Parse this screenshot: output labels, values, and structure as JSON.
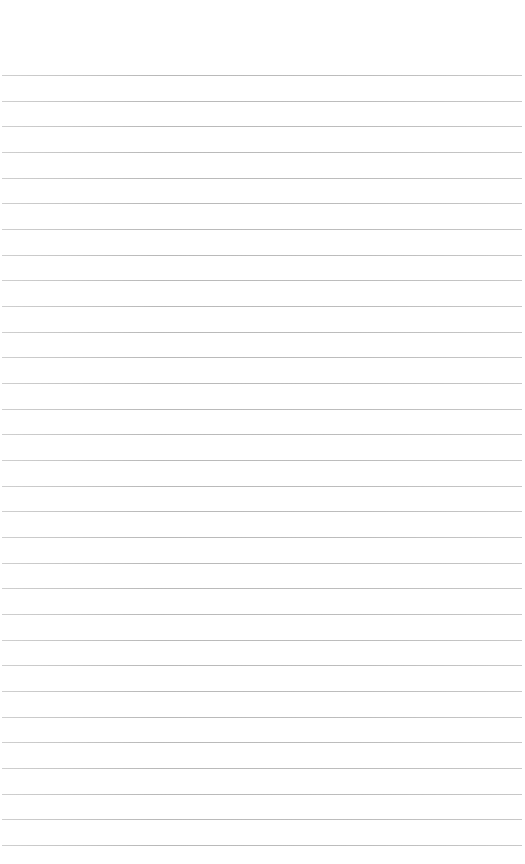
{
  "page": {
    "type": "lined-paper",
    "background_color": "#ffffff",
    "line_color": "#bcbcbc",
    "line_count": 31,
    "first_line_y": 75,
    "last_line_y": 845,
    "line_left": 2,
    "line_right": 522
  }
}
